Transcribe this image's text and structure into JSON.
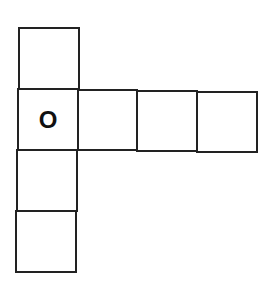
{
  "diagram": {
    "type": "cube-net",
    "cells": [
      {
        "id": "top",
        "label": ""
      },
      {
        "id": "middle-left",
        "label": "O"
      },
      {
        "id": "middle-2",
        "label": ""
      },
      {
        "id": "middle-3",
        "label": ""
      },
      {
        "id": "middle-4",
        "label": ""
      },
      {
        "id": "lower-1",
        "label": ""
      },
      {
        "id": "lower-2",
        "label": ""
      }
    ],
    "line_color": "#222222"
  }
}
